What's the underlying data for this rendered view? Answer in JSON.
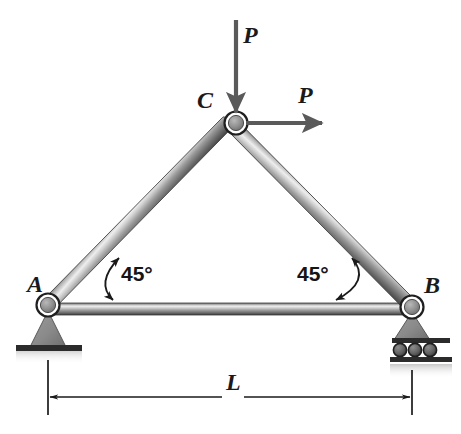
{
  "figure": {
    "kind": "statics-truss-free-body-diagram",
    "background_color": "#ffffff",
    "member_color_dark": "#4a4a4a",
    "member_color_light": "#e6e6e6",
    "ink_color": "#1a1a1a",
    "arrow_color": "#5a5a5a",
    "ground_color": "#2b2b2b"
  },
  "nodes": [
    {
      "id": "A",
      "label": "A",
      "x": 48,
      "y": 305,
      "label_x": 27,
      "label_y": 272,
      "support": "pin"
    },
    {
      "id": "B",
      "label": "B",
      "x": 412,
      "y": 307,
      "label_x": 424,
      "label_y": 273,
      "support": "roller"
    },
    {
      "id": "C",
      "label": "C",
      "x": 236,
      "y": 123,
      "label_x": 197,
      "label_y": 88,
      "support": "none"
    }
  ],
  "members": [
    {
      "id": "AC",
      "from": "A",
      "to": "C",
      "thickness": 14
    },
    {
      "id": "CB",
      "from": "C",
      "to": "B",
      "thickness": 14
    },
    {
      "id": "AB",
      "from": "A",
      "to": "B",
      "thickness": 12
    }
  ],
  "loads": [
    {
      "id": "vertical-load",
      "label": "P",
      "direction": "down",
      "at_node": "C",
      "tail_x": 236,
      "tail_y": 20,
      "head_x": 236,
      "head_y": 112,
      "label_x": 243,
      "label_y": 23
    },
    {
      "id": "horizontal-load",
      "label": "P",
      "direction": "right",
      "at_node": "C",
      "tail_x": 246,
      "tail_y": 123,
      "head_x": 322,
      "head_y": 123,
      "label_x": 298,
      "label_y": 83
    }
  ],
  "angles": [
    {
      "id": "angle-left",
      "label": "45°",
      "at_node": "A",
      "value": 45,
      "unit": "deg",
      "label_x": 121,
      "label_y": 263
    },
    {
      "id": "angle-right",
      "label": "45°",
      "at_node": "B",
      "value": 45,
      "unit": "deg",
      "label_x": 297,
      "label_y": 263
    }
  ],
  "dimension": {
    "id": "span-dimension",
    "label": "L",
    "from_x": 48,
    "to_x": 412,
    "line_y": 397,
    "ext_top_y": 360,
    "ext_bottom_y": 415,
    "label_x": 228,
    "label_y": 374
  },
  "supports": {
    "pin": {
      "node": "A",
      "type": "pin",
      "base_label": "fixed-ground-hatch"
    },
    "roller": {
      "node": "B",
      "type": "roller",
      "roller_count": 3
    }
  },
  "top_artifact": {
    "text": "P",
    "x": 388,
    "y": 0
  }
}
